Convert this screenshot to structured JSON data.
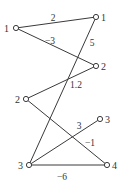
{
  "diagram": {
    "type": "weighted bipartite graph",
    "nodes": [
      {
        "id": "L1",
        "label": "1",
        "side": "left",
        "x": 16,
        "y": 28,
        "lx": 4,
        "ly": 32
      },
      {
        "id": "R1",
        "label": "1",
        "side": "right",
        "x": 96,
        "y": 17,
        "lx": 101,
        "ly": 21
      },
      {
        "id": "R2",
        "label": "2",
        "side": "right",
        "x": 96,
        "y": 66,
        "lx": 101,
        "ly": 70
      },
      {
        "id": "L2",
        "label": "2",
        "side": "left",
        "x": 26,
        "y": 99,
        "lx": 15,
        "ly": 103
      },
      {
        "id": "R3",
        "label": "3",
        "side": "right",
        "x": 100,
        "y": 119,
        "lx": 105,
        "ly": 123
      },
      {
        "id": "L3",
        "label": "3",
        "side": "left",
        "x": 29,
        "y": 165,
        "lx": 18,
        "ly": 169
      },
      {
        "id": "R4",
        "label": "4",
        "side": "right",
        "x": 107,
        "y": 165,
        "lx": 112,
        "ly": 169
      }
    ],
    "edges": [
      {
        "from": "L1",
        "to": "R1",
        "weight": "2",
        "wx": 53,
        "wy": 21
      },
      {
        "from": "L1",
        "to": "R2",
        "weight": "−3",
        "wx": 50,
        "wy": 44
      },
      {
        "from": "R1",
        "to": "L3",
        "weight": "5",
        "wx": 92,
        "wy": 46
      },
      {
        "from": "L2",
        "to": "R2",
        "weight": "1.2",
        "wx": 76,
        "wy": 88
      },
      {
        "from": "L2",
        "to": "R4",
        "weight": "−1",
        "wx": 90,
        "wy": 146
      },
      {
        "from": "L3",
        "to": "R3",
        "weight": "3",
        "wx": 79,
        "wy": 129
      },
      {
        "from": "L3",
        "to": "R4",
        "weight": "−6",
        "wx": 62,
        "wy": 180
      }
    ]
  }
}
